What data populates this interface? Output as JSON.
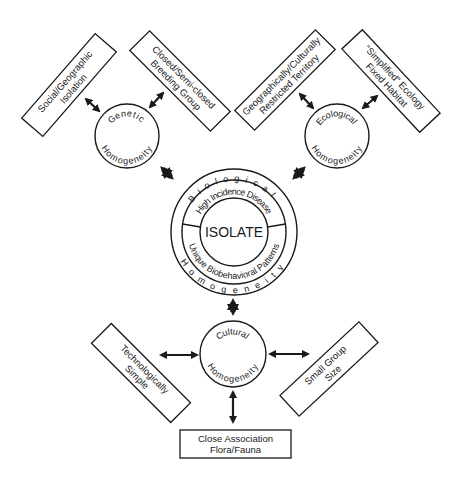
{
  "diagram": {
    "colors": {
      "stroke": "#1a1a1a",
      "background": "#ffffff"
    },
    "core": {
      "label": "ISOLATE",
      "inner_ring_top": "High Incidence Disease",
      "inner_ring_bottom": "Unique Biobehavioral Patterns",
      "outer_ring_top": "Biological",
      "outer_ring_bottom": "Homogeneity"
    },
    "nodes": {
      "genetic": {
        "top": "Genetic",
        "bottom": "Homogeneity"
      },
      "ecological": {
        "top": "Ecological",
        "bottom": "Homogeneity"
      },
      "cultural": {
        "top": "Cultural",
        "bottom": "Homogeneity"
      }
    },
    "boxes": {
      "social_geographic": {
        "line1": "Social/Geographic",
        "line2": "Isolation"
      },
      "breeding_group": {
        "line1": "Closed/Semi-closed",
        "line2": "Breeding Group"
      },
      "restricted_territory": {
        "line1": "Geographically/Culturally",
        "line2": "Restricted Territory"
      },
      "simplified_ecology": {
        "line1": "“Simplified” Ecology",
        "line2": "Fixed Habitat"
      },
      "technologically_simple": {
        "line1": "Technologically",
        "line2": "Simple"
      },
      "small_group": {
        "line1": "Small Group",
        "line2": "Size"
      },
      "flora_fauna": {
        "line1": "Close Association",
        "line2": "Flora/Fauna"
      }
    },
    "connections": [
      {
        "from": "social_geographic",
        "to": "genetic",
        "type": "double-arrow"
      },
      {
        "from": "breeding_group",
        "to": "genetic",
        "type": "double-arrow"
      },
      {
        "from": "restricted_territory",
        "to": "ecological",
        "type": "double-arrow"
      },
      {
        "from": "simplified_ecology",
        "to": "ecological",
        "type": "double-arrow"
      },
      {
        "from": "genetic",
        "to": "core",
        "type": "bold-double-arrow"
      },
      {
        "from": "ecological",
        "to": "core",
        "type": "bold-double-arrow"
      },
      {
        "from": "cultural",
        "to": "core",
        "type": "bold-double-arrow"
      },
      {
        "from": "technologically_simple",
        "to": "cultural",
        "type": "double-arrow"
      },
      {
        "from": "small_group",
        "to": "cultural",
        "type": "double-arrow"
      },
      {
        "from": "flora_fauna",
        "to": "cultural",
        "type": "double-arrow"
      }
    ]
  }
}
